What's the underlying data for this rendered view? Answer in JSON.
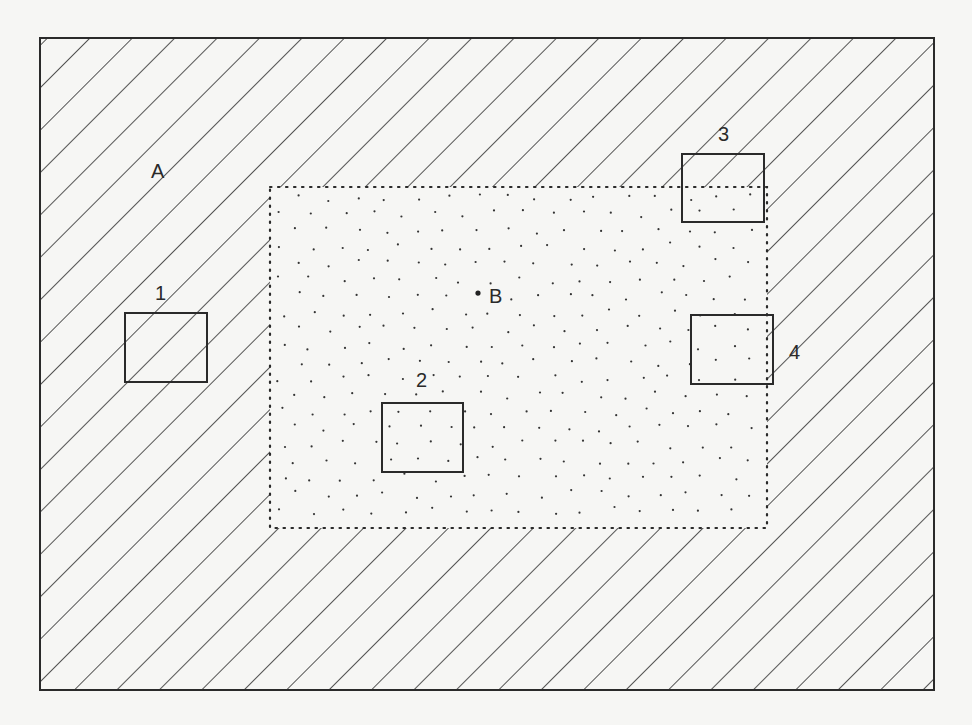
{
  "diagram": {
    "colors": {
      "background": "#f6f6f4",
      "line": "#2a2a2a",
      "stipple": "#333333"
    },
    "regions": [
      {
        "id": "A",
        "label": "A",
        "fill": "diagonal-hatch",
        "bounds": {
          "x": 40,
          "y": 38,
          "w": 894,
          "h": 652
        }
      },
      {
        "id": "B",
        "label": "B",
        "fill": "random-dots",
        "border": "dotted",
        "bounds": {
          "x": 270,
          "y": 187,
          "w": 497,
          "h": 341
        }
      }
    ],
    "labels": {
      "A": "A",
      "B": "B",
      "box1": "1",
      "box2": "2",
      "box3": "3",
      "box4": "4"
    },
    "boxes": [
      {
        "id": "1",
        "label": "1",
        "bounds": {
          "x": 125,
          "y": 313,
          "w": 82,
          "h": 69
        },
        "location": "fully in region A"
      },
      {
        "id": "2",
        "label": "2",
        "bounds": {
          "x": 382,
          "y": 403,
          "w": 81,
          "h": 69
        },
        "location": "fully in region B"
      },
      {
        "id": "3",
        "label": "3",
        "bounds": {
          "x": 682,
          "y": 154,
          "w": 82,
          "h": 68
        },
        "location": "straddles A/B corner"
      },
      {
        "id": "4",
        "label": "4",
        "bounds": {
          "x": 691,
          "y": 315,
          "w": 82,
          "h": 69
        },
        "location": "straddles A/B right edge"
      }
    ]
  }
}
